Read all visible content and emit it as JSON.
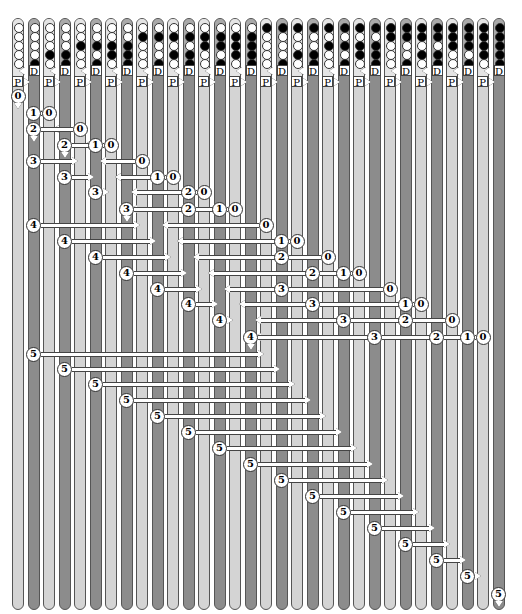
{
  "colors": {
    "light_column": "#d4d4d4",
    "dark_column": "#8c8c8c",
    "bit_on": "#000000",
    "bit_off": "#ffffff",
    "wire": "#ffffff"
  },
  "columns": {
    "count": 32,
    "bits_per_column": 5,
    "labels": {
      "p": "P",
      "d": "D"
    }
  },
  "rows": [
    {
      "y": 96,
      "nodes": [
        {
          "col": 0,
          "label": "0",
          "down": true
        }
      ]
    },
    {
      "y": 113,
      "nodes": [
        {
          "col": 1,
          "label": "1"
        },
        {
          "col": 2,
          "label": "0"
        }
      ],
      "arrow": {
        "from": 2,
        "to": 1
      }
    },
    {
      "y": 129,
      "nodes": [
        {
          "col": 1,
          "label": "2",
          "down": true
        },
        {
          "col": 4,
          "label": "0"
        }
      ],
      "arrow": {
        "from": 4,
        "to": 2
      }
    },
    {
      "y": 145,
      "nodes": [
        {
          "col": 3,
          "label": "2",
          "down": true
        },
        {
          "col": 5,
          "label": "1"
        },
        {
          "col": 6,
          "label": "0"
        }
      ],
      "arrow": {
        "from": 5,
        "to": 4
      }
    },
    {
      "y": 161,
      "nodes": [
        {
          "col": 1,
          "label": "3"
        },
        {
          "col": 8,
          "label": "0"
        }
      ],
      "arrow_r": {
        "from": 1,
        "to": 4
      },
      "arrow_l": {
        "from": 8,
        "to": 5
      }
    },
    {
      "y": 177,
      "nodes": [
        {
          "col": 3,
          "label": "3"
        },
        {
          "col": 9,
          "label": "1"
        },
        {
          "col": 10,
          "label": "0"
        }
      ],
      "arrow_r": {
        "from": 3,
        "to": 5
      },
      "arrow_l": {
        "from": 9,
        "to": 6
      }
    },
    {
      "y": 192,
      "nodes": [
        {
          "col": 5,
          "label": "3"
        },
        {
          "col": 11,
          "label": "2"
        },
        {
          "col": 12,
          "label": "0"
        }
      ],
      "arrow_r": {
        "from": 5,
        "to": 6
      },
      "arrow_l": {
        "from": 11,
        "to": 7
      }
    },
    {
      "y": 209,
      "nodes": [
        {
          "col": 7,
          "label": "3",
          "down": true
        },
        {
          "col": 11,
          "label": "2"
        },
        {
          "col": 13,
          "label": "1"
        },
        {
          "col": 14,
          "label": "0"
        }
      ],
      "arrow_l": {
        "from": 11,
        "to": 7
      }
    },
    {
      "y": 225,
      "nodes": [
        {
          "col": 1,
          "label": "4"
        },
        {
          "col": 16,
          "label": "0"
        }
      ],
      "arrow_r": {
        "from": 1,
        "to": 8
      },
      "arrow_l": {
        "from": 16,
        "to": 9
      }
    },
    {
      "y": 241,
      "nodes": [
        {
          "col": 3,
          "label": "4"
        },
        {
          "col": 17,
          "label": "1"
        },
        {
          "col": 18,
          "label": "0"
        }
      ],
      "arrow_r": {
        "from": 3,
        "to": 9
      },
      "arrow_l": {
        "from": 17,
        "to": 10
      }
    },
    {
      "y": 257,
      "nodes": [
        {
          "col": 5,
          "label": "4"
        },
        {
          "col": 17,
          "label": "2"
        },
        {
          "col": 20,
          "label": "0"
        }
      ],
      "arrow_r": {
        "from": 5,
        "to": 10
      },
      "arrow_l": {
        "from": 17,
        "to": 11
      }
    },
    {
      "y": 273,
      "nodes": [
        {
          "col": 7,
          "label": "4"
        },
        {
          "col": 19,
          "label": "2"
        },
        {
          "col": 21,
          "label": "1"
        },
        {
          "col": 22,
          "label": "0"
        }
      ],
      "arrow_r": {
        "from": 7,
        "to": 11
      },
      "arrow_l": {
        "from": 19,
        "to": 12
      }
    },
    {
      "y": 289,
      "nodes": [
        {
          "col": 9,
          "label": "4"
        },
        {
          "col": 17,
          "label": "3"
        },
        {
          "col": 24,
          "label": "0"
        }
      ],
      "arrow_r": {
        "from": 9,
        "to": 12
      },
      "arrow_l": {
        "from": 17,
        "to": 13
      }
    },
    {
      "y": 304,
      "nodes": [
        {
          "col": 11,
          "label": "4"
        },
        {
          "col": 19,
          "label": "3"
        },
        {
          "col": 25,
          "label": "1"
        },
        {
          "col": 26,
          "label": "0"
        }
      ],
      "arrow_r": {
        "from": 11,
        "to": 13
      },
      "arrow_l": {
        "from": 19,
        "to": 14
      }
    },
    {
      "y": 320,
      "nodes": [
        {
          "col": 13,
          "label": "4"
        },
        {
          "col": 21,
          "label": "3"
        },
        {
          "col": 25,
          "label": "2"
        },
        {
          "col": 28,
          "label": "0"
        }
      ],
      "arrow_r": {
        "from": 13,
        "to": 14
      },
      "arrow_l": {
        "from": 21,
        "to": 15
      }
    },
    {
      "y": 337,
      "nodes": [
        {
          "col": 15,
          "label": "4",
          "down": true
        },
        {
          "col": 23,
          "label": "3"
        },
        {
          "col": 27,
          "label": "2"
        },
        {
          "col": 29,
          "label": "1"
        },
        {
          "col": 30,
          "label": "0"
        }
      ],
      "arrow_l": {
        "from": 23,
        "to": 15
      }
    },
    {
      "y": 354,
      "nodes": [
        {
          "col": 1,
          "label": "5"
        }
      ],
      "arrow_r": {
        "from": 1,
        "to": 16
      }
    },
    {
      "y": 369,
      "nodes": [
        {
          "col": 3,
          "label": "5"
        }
      ],
      "arrow_r": {
        "from": 3,
        "to": 17
      }
    },
    {
      "y": 384,
      "nodes": [
        {
          "col": 5,
          "label": "5"
        }
      ],
      "arrow_r": {
        "from": 5,
        "to": 18
      }
    },
    {
      "y": 400,
      "nodes": [
        {
          "col": 7,
          "label": "5"
        }
      ],
      "arrow_r": {
        "from": 7,
        "to": 19
      }
    },
    {
      "y": 416,
      "nodes": [
        {
          "col": 9,
          "label": "5"
        }
      ],
      "arrow_r": {
        "from": 9,
        "to": 20
      }
    },
    {
      "y": 432,
      "nodes": [
        {
          "col": 11,
          "label": "5"
        }
      ],
      "arrow_r": {
        "from": 11,
        "to": 21
      }
    },
    {
      "y": 448,
      "nodes": [
        {
          "col": 13,
          "label": "5"
        }
      ],
      "arrow_r": {
        "from": 13,
        "to": 22
      }
    },
    {
      "y": 464,
      "nodes": [
        {
          "col": 15,
          "label": "5"
        }
      ],
      "arrow_r": {
        "from": 15,
        "to": 23
      }
    },
    {
      "y": 480,
      "nodes": [
        {
          "col": 17,
          "label": "5"
        }
      ],
      "arrow_r": {
        "from": 17,
        "to": 24
      }
    },
    {
      "y": 496,
      "nodes": [
        {
          "col": 19,
          "label": "5"
        }
      ],
      "arrow_r": {
        "from": 19,
        "to": 25
      }
    },
    {
      "y": 512,
      "nodes": [
        {
          "col": 21,
          "label": "5"
        }
      ],
      "arrow_r": {
        "from": 21,
        "to": 26
      }
    },
    {
      "y": 528,
      "nodes": [
        {
          "col": 23,
          "label": "5"
        }
      ],
      "arrow_r": {
        "from": 23,
        "to": 27
      }
    },
    {
      "y": 544,
      "nodes": [
        {
          "col": 25,
          "label": "5"
        }
      ],
      "arrow_r": {
        "from": 25,
        "to": 28
      }
    },
    {
      "y": 560,
      "nodes": [
        {
          "col": 27,
          "label": "5"
        }
      ],
      "arrow_r": {
        "from": 27,
        "to": 29
      }
    },
    {
      "y": 576,
      "nodes": [
        {
          "col": 29,
          "label": "5"
        }
      ],
      "arrow_r": {
        "from": 29,
        "to": 30
      }
    },
    {
      "y": 594,
      "nodes": [
        {
          "col": 31,
          "label": "5",
          "down": true
        }
      ]
    }
  ]
}
